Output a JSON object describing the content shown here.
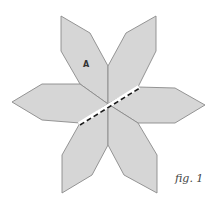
{
  "figure": {
    "caption": "fig. 1",
    "marker_label": "A",
    "petal_count": 6,
    "colors": {
      "petal_fill": "#d6d6d6",
      "petal_stroke": "#8a8a8a",
      "cut_line": "#1a1a1a",
      "background": "#ffffff"
    }
  }
}
